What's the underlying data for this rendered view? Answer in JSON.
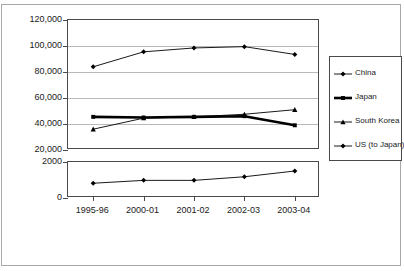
{
  "chart_data": {
    "type": "line",
    "title": "",
    "subtitle": "",
    "xlabel": "",
    "ylabel": "",
    "grid": true,
    "legend_position": "right",
    "broken_axis": true,
    "categories": [
      "1995-96",
      "2000-01",
      "2001-02",
      "2002-03",
      "2003-04"
    ],
    "panels": [
      {
        "name": "upper-panel",
        "ylim": [
          20000,
          120000
        ],
        "yticks": [
          20000,
          40000,
          60000,
          80000,
          100000,
          120000
        ],
        "ytick_labels": [
          "20,000",
          "40,000",
          "60,000",
          "80,000",
          "100,000",
          "120,000"
        ],
        "series": [
          {
            "name": "China",
            "marker": "diamond",
            "line_weight": "thin",
            "color": "#000000",
            "values": [
              84000,
              95500,
              98500,
              99500,
              93500
            ]
          },
          {
            "name": "Japan",
            "marker": "square",
            "line_weight": "thick",
            "color": "#000000",
            "values": [
              45500,
              45000,
              45500,
              46000,
              39000
            ]
          },
          {
            "name": "South Korea",
            "marker": "triangle",
            "line_weight": "thin",
            "color": "#000000",
            "values": [
              36000,
              44500,
              45500,
              47500,
              51000
            ]
          }
        ]
      },
      {
        "name": "lower-panel",
        "ylim": [
          0,
          2000
        ],
        "yticks": [
          0,
          2000
        ],
        "ytick_labels": [
          "0",
          "2000"
        ],
        "series": [
          {
            "name": "US (to Japan)",
            "marker": "diamond",
            "line_weight": "thin",
            "color": "#000000",
            "values": [
              820,
              980,
              980,
              1180,
              1500
            ]
          }
        ]
      }
    ],
    "legend": [
      {
        "label": "China",
        "marker": "diamond",
        "line_weight": "thin"
      },
      {
        "label": "Japan",
        "marker": "square",
        "line_weight": "thick"
      },
      {
        "label": "South Korea",
        "marker": "triangle",
        "line_weight": "thin"
      },
      {
        "label": "US (to Japan)",
        "marker": "diamond",
        "line_weight": "thin"
      }
    ]
  }
}
